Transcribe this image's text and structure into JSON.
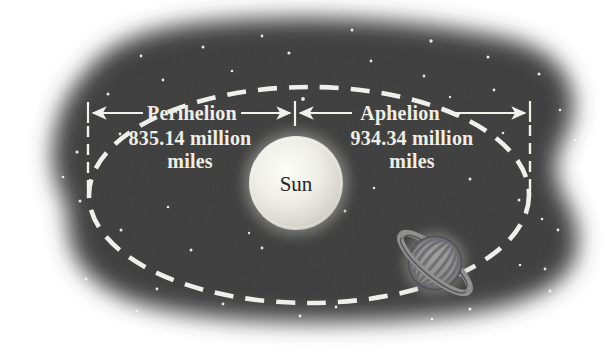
{
  "labels": {
    "sun": "Sun",
    "perihelion": {
      "title": "Perihelion",
      "value": "835.14 million",
      "unit": "miles"
    },
    "aphelion": {
      "title": "Aphelion",
      "value": "934.34 million",
      "unit": "miles"
    }
  },
  "colors": {
    "page_background": "#ffffff",
    "space": "#3e3e3e",
    "star": "#f5f5f2",
    "orbit_dash": "#efefeb",
    "dimension_line": "#f2f1ec",
    "label_text": "#f0ede5",
    "sun_core": "#fdfdf9",
    "sun_edge": "#b9b9b1",
    "sun_label_text": "#262626",
    "planet_body_light": "#a0a09e",
    "planet_body_dark": "#72726f",
    "planet_band": "#63636a",
    "planet_ring": "#90908e",
    "planet_outline": "#45454a"
  },
  "stars": [
    [
      289,
      53,
      1.6
    ],
    [
      203,
      47,
      1.5
    ],
    [
      262,
      36,
      1.4
    ],
    [
      352,
      30,
      1.5
    ],
    [
      431,
      41,
      1.7
    ],
    [
      488,
      57,
      1.5
    ],
    [
      539,
      74,
      1.5
    ],
    [
      141,
      56,
      1.4
    ],
    [
      108,
      94,
      1.5
    ],
    [
      163,
      80,
      1.4
    ],
    [
      232,
      71,
      1.3
    ],
    [
      303,
      99,
      1.9
    ],
    [
      371,
      61,
      1.4
    ],
    [
      424,
      76,
      1.4
    ],
    [
      494,
      90,
      1.4
    ],
    [
      560,
      110,
      1.3
    ],
    [
      575,
      140,
      1.2
    ],
    [
      77,
      152,
      1.6
    ],
    [
      63,
      177,
      1.3
    ],
    [
      120,
      134,
      1.4
    ],
    [
      80,
      201,
      1.5
    ],
    [
      56,
      245,
      1.4
    ],
    [
      86,
      279,
      1.4
    ],
    [
      121,
      230,
      1.5
    ],
    [
      157,
      289,
      1.4
    ],
    [
      137,
      311,
      1.3
    ],
    [
      191,
      250,
      1.5
    ],
    [
      223,
      304,
      1.4
    ],
    [
      168,
      207,
      1.3
    ],
    [
      262,
      248,
      1.4
    ],
    [
      300,
      316,
      1.4
    ],
    [
      336,
      307,
      1.4
    ],
    [
      345,
      211,
      1.5
    ],
    [
      374,
      188,
      1.3
    ],
    [
      470,
      179,
      1.5
    ],
    [
      519,
      200,
      1.5
    ],
    [
      542,
      219,
      1.3
    ],
    [
      558,
      230,
      1.4
    ],
    [
      545,
      269,
      1.4
    ],
    [
      470,
      309,
      1.5
    ],
    [
      432,
      319,
      1.3
    ],
    [
      520,
      265,
      1.3
    ],
    [
      550,
      291,
      1.4
    ],
    [
      503,
      133,
      1.3
    ],
    [
      450,
      97,
      1.2
    ],
    [
      249,
      233,
      1.2
    ]
  ]
}
